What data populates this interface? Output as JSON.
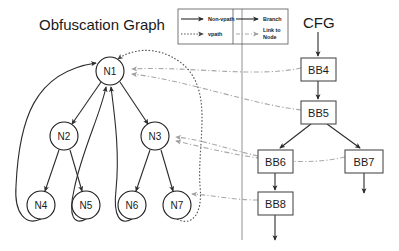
{
  "titles": {
    "left": "Obfuscation Graph",
    "right": "CFG"
  },
  "legend": {
    "items": [
      {
        "label": "Non-vpath",
        "style": "solid-black-arrow",
        "color": "#2b2b2b"
      },
      {
        "label": "Branch",
        "style": "solid-black-arrow",
        "color": "#2b2b2b"
      },
      {
        "label": "vpath",
        "style": "dotted-black-arrow",
        "color": "#555555"
      },
      {
        "label": "Link to Node",
        "style": "dashdot-gray-arrow",
        "color": "#a8a8a8"
      }
    ]
  },
  "obfuscation_graph": {
    "nodes": [
      {
        "id": "N1",
        "label": "N1",
        "cx": 110,
        "cy": 71,
        "r": 14
      },
      {
        "id": "N2",
        "label": "N2",
        "cx": 64,
        "cy": 136,
        "r": 14
      },
      {
        "id": "N3",
        "label": "N3",
        "cx": 155,
        "cy": 136,
        "r": 14
      },
      {
        "id": "N4",
        "label": "N4",
        "cx": 41,
        "cy": 205,
        "r": 14
      },
      {
        "id": "N5",
        "label": "N5",
        "cx": 86,
        "cy": 205,
        "r": 14
      },
      {
        "id": "N6",
        "label": "N6",
        "cx": 132,
        "cy": 205,
        "r": 14
      },
      {
        "id": "N7",
        "label": "N7",
        "cx": 177,
        "cy": 205,
        "r": 14
      }
    ],
    "edges": [
      {
        "from": "N1",
        "to": "N2",
        "type": "non-vpath"
      },
      {
        "from": "N1",
        "to": "N3",
        "type": "non-vpath"
      },
      {
        "from": "N2",
        "to": "N4",
        "type": "non-vpath"
      },
      {
        "from": "N2",
        "to": "N5",
        "type": "non-vpath"
      },
      {
        "from": "N3",
        "to": "N6",
        "type": "non-vpath"
      },
      {
        "from": "N3",
        "to": "N7",
        "type": "non-vpath"
      },
      {
        "from": "N4",
        "to": "N1",
        "type": "non-vpath"
      },
      {
        "from": "N5",
        "to": "N1",
        "type": "non-vpath"
      },
      {
        "from": "N6",
        "to": "N1",
        "type": "non-vpath"
      },
      {
        "from": "N7",
        "to": "N1",
        "type": "vpath"
      }
    ]
  },
  "cfg": {
    "blocks": [
      {
        "id": "BB4",
        "label": "BB4",
        "x": 301,
        "y": 58,
        "w": 35,
        "h": 23
      },
      {
        "id": "BB5",
        "label": "BB5",
        "x": 301,
        "y": 101,
        "w": 35,
        "h": 23
      },
      {
        "id": "BB6",
        "label": "BB6",
        "x": 258,
        "y": 150,
        "w": 35,
        "h": 23
      },
      {
        "id": "BB7",
        "label": "BB7",
        "x": 345,
        "y": 150,
        "w": 38,
        "h": 23
      },
      {
        "id": "BB8",
        "label": "BB8",
        "x": 258,
        "y": 192,
        "w": 35,
        "h": 23
      }
    ],
    "edges": [
      {
        "from": "entry",
        "to": "BB4",
        "type": "branch"
      },
      {
        "from": "BB4",
        "to": "BB5",
        "type": "branch"
      },
      {
        "from": "BB5",
        "to": "BB6",
        "type": "branch"
      },
      {
        "from": "BB5",
        "to": "BB7",
        "type": "branch"
      },
      {
        "from": "BB6",
        "to": "BB8",
        "type": "branch"
      },
      {
        "from": "BB7",
        "to": "exit",
        "type": "branch"
      },
      {
        "from": "BB8",
        "to": "exit",
        "type": "branch"
      }
    ]
  },
  "links": [
    {
      "from": "BB4",
      "to": "N1",
      "type": "link-to-node"
    },
    {
      "from": "BB5",
      "to": "N1",
      "type": "link-to-node"
    },
    {
      "from": "BB6",
      "to": "N3",
      "type": "link-to-node"
    },
    {
      "from": "BB7",
      "to": "N3",
      "type": "link-to-node"
    },
    {
      "from": "BB8",
      "to": "N7",
      "type": "link-to-node"
    }
  ],
  "colors": {
    "stroke_black": "#2b2b2b",
    "stroke_gray": "#a8a8a8",
    "stroke_dotted": "#555555",
    "box_border": "#4d4d4d",
    "background": "#ffffff"
  }
}
